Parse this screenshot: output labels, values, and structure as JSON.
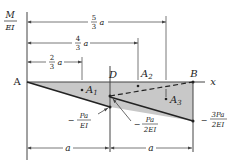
{
  "axes": {
    "y_label_num": "M",
    "y_label_den": "EI",
    "x_label": "x"
  },
  "points": {
    "A": "A",
    "D": "D",
    "B": "B"
  },
  "areas": {
    "a1": "A",
    "a1_sub": "1",
    "a2": "A",
    "a2_sub": "2",
    "a3": "A",
    "a3_sub": "3"
  },
  "dimensions": {
    "top": [
      {
        "num": "5",
        "den": "3",
        "var": "a"
      },
      {
        "num": "4",
        "den": "3",
        "var": "a"
      },
      {
        "num": "2",
        "den": "3",
        "var": "a"
      }
    ],
    "bottom": [
      {
        "label": "a"
      },
      {
        "label": "a"
      }
    ]
  },
  "values": {
    "at_D_num": "Pa",
    "at_D_den": "EI",
    "at_D_sign": "−",
    "mid_num": "Pa",
    "mid_den": "2EI",
    "mid_sign": "−",
    "at_B_num": "3Pa",
    "at_B_den": "2EI",
    "at_B_sign": "−"
  },
  "colors": {
    "fill": "#c8c8c8",
    "line": "#222222"
  }
}
